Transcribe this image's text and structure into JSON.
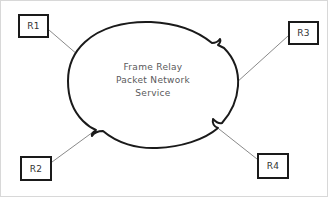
{
  "diagram": {
    "title": "Frame Relay Packet Network Service",
    "background_color": "#ffffff",
    "border_color": "#d8d8d8",
    "cloud": {
      "name": "frame-relay-cloud",
      "stroke_color": "#1a1a1a",
      "fill_color": "#ffffff",
      "label_color": "#59595b",
      "label_lines": [
        "Frame Relay",
        "Packet Network",
        "Service"
      ],
      "line1": "Frame Relay",
      "line2": "Packet Network",
      "line3": "Service"
    },
    "nodes": [
      {
        "id": "r1",
        "label": "R1",
        "position": "top-left"
      },
      {
        "id": "r3",
        "label": "R3",
        "position": "top-right"
      },
      {
        "id": "r2",
        "label": "R2",
        "position": "bottom-left"
      },
      {
        "id": "r4",
        "label": "R4",
        "position": "bottom-right"
      }
    ],
    "node_labels": {
      "r1": "R1",
      "r2": "R2",
      "r3": "R3",
      "r4": "R4"
    },
    "connectors": [
      {
        "from": "r1",
        "to": "frame-relay-cloud"
      },
      {
        "from": "r2",
        "to": "frame-relay-cloud"
      },
      {
        "from": "r3",
        "to": "frame-relay-cloud"
      },
      {
        "from": "r4",
        "to": "frame-relay-cloud"
      }
    ],
    "colors": {
      "node_border": "#1a1a1a",
      "node_text": "#333333",
      "connector": "#8a8a8a",
      "cloud_stroke": "#1a1a1a"
    }
  }
}
